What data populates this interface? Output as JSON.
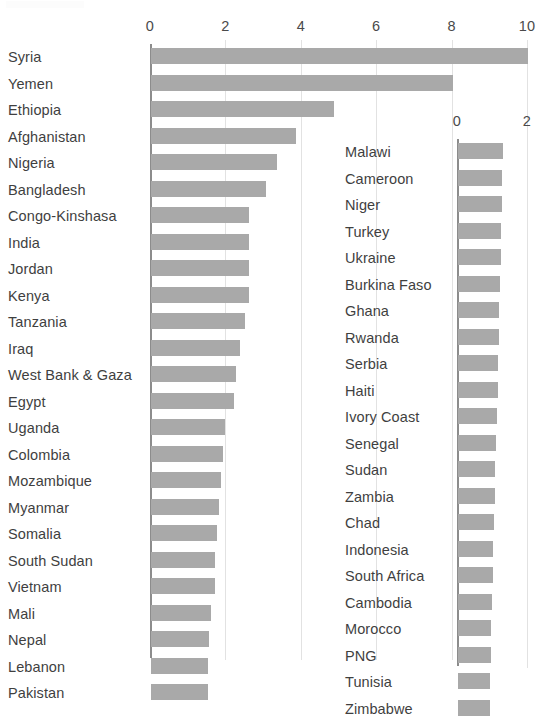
{
  "chart_data": {
    "type": "bar",
    "orientation": "horizontal",
    "title": "",
    "xlabel": "",
    "ylabel": "",
    "grid": true,
    "legend": "none",
    "bar_color": "#a9a9a9",
    "panels": [
      {
        "name": "left-panel",
        "xlim": [
          0,
          10
        ],
        "xticks": [
          "0",
          "2",
          "4",
          "6",
          "8",
          "10"
        ],
        "xtick_values": [
          0,
          2,
          4,
          6,
          8,
          10
        ],
        "categories": [
          "Syria",
          "Yemen",
          "Ethiopia",
          "Afghanistan",
          "Nigeria",
          "Bangladesh",
          "Congo-Kinshasa",
          "India",
          "Jordan",
          "Kenya",
          "Tanzania",
          "Iraq",
          "West Bank & Gaza",
          "Egypt",
          "Uganda",
          "Colombia",
          "Mozambique",
          "Myanmar",
          "Somalia",
          "South Sudan",
          "Vietnam",
          "Mali",
          "Nepal",
          "Lebanon",
          "Pakistan"
        ],
        "values": [
          10.0,
          8.0,
          4.85,
          3.85,
          3.35,
          3.05,
          2.6,
          2.6,
          2.6,
          2.6,
          2.5,
          2.35,
          2.25,
          2.2,
          1.95,
          1.9,
          1.85,
          1.8,
          1.75,
          1.7,
          1.7,
          1.6,
          1.55,
          1.5,
          1.5
        ]
      },
      {
        "name": "right-panel",
        "xlim": [
          0,
          2
        ],
        "xticks": [
          "0",
          "2"
        ],
        "xtick_values": [
          0,
          2
        ],
        "categories": [
          "Malawi",
          "Cameroon",
          "Niger",
          "Turkey",
          "Ukraine",
          "Burkina Faso",
          "Ghana",
          "Rwanda",
          "Serbia",
          "Haiti",
          "Ivory Coast",
          "Senegal",
          "Sudan",
          "Zambia",
          "Chad",
          "Indonesia",
          "South Africa",
          "Cambodia",
          "Morocco",
          "PNG",
          "Tunisia",
          "Zimbabwe"
        ],
        "values": [
          1.29,
          1.27,
          1.25,
          1.24,
          1.22,
          1.2,
          1.18,
          1.17,
          1.15,
          1.13,
          1.11,
          1.09,
          1.07,
          1.05,
          1.03,
          1.01,
          0.99,
          0.97,
          0.95,
          0.93,
          0.91,
          0.9
        ]
      }
    ]
  }
}
